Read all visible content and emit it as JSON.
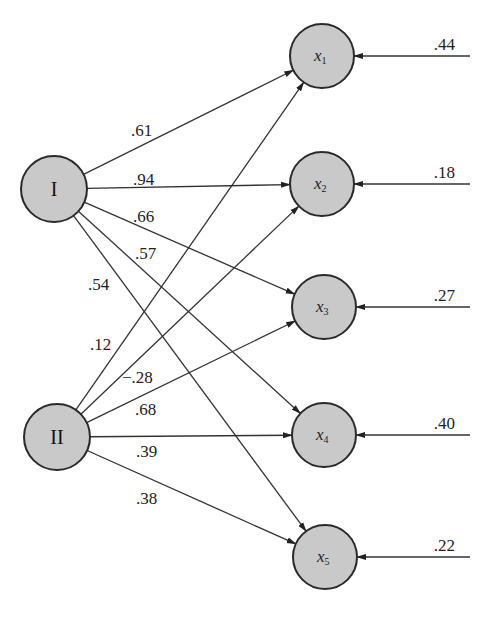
{
  "diagram": {
    "type": "path-diagram",
    "factors": [
      {
        "id": "I",
        "label": "I",
        "cx": 54,
        "cy": 189
      },
      {
        "id": "II",
        "label": "II",
        "cx": 57,
        "cy": 437
      }
    ],
    "variables": [
      {
        "id": "x1",
        "label": "x",
        "sub": "1",
        "cx": 322,
        "cy": 56,
        "error": ".44"
      },
      {
        "id": "x2",
        "label": "x",
        "sub": "2",
        "cx": 322,
        "cy": 184,
        "error": ".18"
      },
      {
        "id": "x3",
        "label": "x",
        "sub": "3",
        "cx": 324,
        "cy": 307,
        "error": ".27"
      },
      {
        "id": "x4",
        "label": "x",
        "sub": "4",
        "cx": 324,
        "cy": 435,
        "error": ".40"
      },
      {
        "id": "x5",
        "label": "x",
        "sub": "5",
        "cx": 325,
        "cy": 557,
        "error": ".22"
      }
    ],
    "loadings": [
      {
        "from": "I",
        "to": "x1",
        "value": ".61",
        "lx": 131,
        "ly": 136
      },
      {
        "from": "I",
        "to": "x2",
        "value": ".94",
        "lx": 133,
        "ly": 185
      },
      {
        "from": "I",
        "to": "x3",
        "value": ".66",
        "lx": 133,
        "ly": 222
      },
      {
        "from": "I",
        "to": "x4",
        "value": ".57",
        "lx": 135,
        "ly": 259
      },
      {
        "from": "I",
        "to": "x5",
        "value": ".54",
        "lx": 88,
        "ly": 290
      },
      {
        "from": "II",
        "to": "x1",
        "value": ".12",
        "lx": 90,
        "ly": 350
      },
      {
        "from": "II",
        "to": "x2",
        "value": "−.28",
        "lx": 122,
        "ly": 383
      },
      {
        "from": "II",
        "to": "x3",
        "value": ".68",
        "lx": 135,
        "ly": 415
      },
      {
        "from": "II",
        "to": "x4",
        "value": ".39",
        "lx": 136,
        "ly": 457
      },
      {
        "from": "II",
        "to": "x5",
        "value": ".38",
        "lx": 136,
        "ly": 504
      }
    ],
    "colors": {
      "node_fill": "#c9c9c9",
      "stroke": "#2a2a2a"
    }
  }
}
